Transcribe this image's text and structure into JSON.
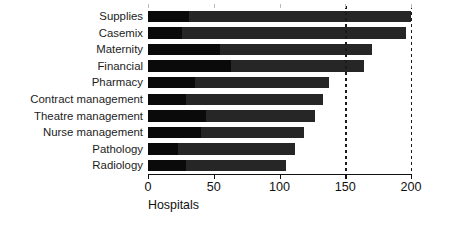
{
  "chart_data": {
    "type": "bar",
    "orientation": "horizontal",
    "stacked": true,
    "title": "",
    "xlabel": "Hospitals",
    "ylabel": "",
    "xlim": [
      0,
      200
    ],
    "xticks": [
      0,
      50,
      100,
      150,
      200
    ],
    "xtick_labels": [
      "0",
      "50",
      "100",
      "150",
      "200"
    ],
    "grid": "dotted vertical gridlines at 150 and 200",
    "gridlines": [
      150,
      200
    ],
    "legend": "none",
    "categories": [
      "Supplies",
      "Casemix",
      "Maternity",
      "Financial",
      "Pharmacy",
      "Contract management",
      "Theatre management",
      "Nurse management",
      "Pathology",
      "Radiology"
    ],
    "series": [
      {
        "name": "segment-1",
        "color": "#0a0a0a",
        "values": [
          31,
          26,
          55,
          63,
          36,
          29,
          44,
          40,
          23,
          29
        ]
      },
      {
        "name": "segment-2",
        "color": "#262626",
        "values": [
          169,
          170,
          115,
          101,
          102,
          104,
          83,
          79,
          89,
          76
        ]
      }
    ],
    "totals": [
      200,
      196,
      170,
      164,
      138,
      133,
      127,
      119,
      112,
      105
    ]
  },
  "axis": {
    "x_title": "Hospitals"
  }
}
